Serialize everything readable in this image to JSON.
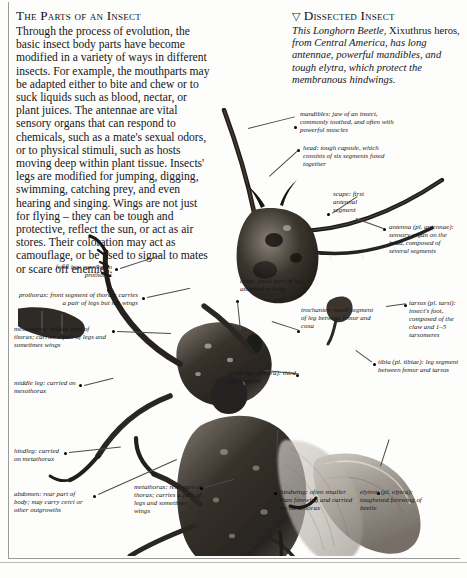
{
  "page": {
    "left_column": {
      "heading": "The Parts of an Insect",
      "body": "Through the process of evolution, the basic insect body parts have become modified in a variety of ways in different insects. For example, the mouthparts may be adapted either to bite and chew or to suck liquids such as blood, nectar, or plant juices. The antennae are vital sensory organs that can respond to chemicals, such as a mate's sexual odors, or to physical stimuli, such as hosts moving deep within plant tissue. Insects' legs are modified for jumping, digging, swimming, catching prey, and even hearing and singing. Wings are not just for flying – they can be tough and protective, reflect the sun, or act as air stores. Their coloration may act as camouflage, or be used to signal to mates or scare off enemies."
    },
    "right_column": {
      "marker": "▽",
      "heading": "Dissected Insect",
      "caption_part1": "This Longhorn Beetle",
      "caption_part2": ", Xixuthrus heros, ",
      "caption_part3": "from Central America, has long antennae, powerful mandibles, and tough elytra, which protect the membranous hindwings."
    },
    "figure": {
      "alt": "dissected longhorn beetle specimen photograph",
      "labels": [
        {
          "id": "mandibles",
          "text": "mandibles: jaw of an insect, commonly toothed, and often with powerful muscles"
        },
        {
          "id": "head",
          "text": "head: tough capsule, which consists of six segments fused together"
        },
        {
          "id": "scape",
          "text": "scape: first antennal segment"
        },
        {
          "id": "antenna",
          "text": "antenna (pl. antennae): sensory organ on the head, composed of several segments"
        },
        {
          "id": "front-leg",
          "text": "front leg: carried on prothorax"
        },
        {
          "id": "prothorax",
          "text": "prothorax: front segment of thorax; carries a pair of legs but not wings"
        },
        {
          "id": "mesothorax",
          "text": "mesothorax: middle part of thorax; carries a pair of legs and sometimes wings"
        },
        {
          "id": "middle-leg",
          "text": "middle leg: carried on mesothorax"
        },
        {
          "id": "hindleg",
          "text": "hindleg: carried on metathorax"
        },
        {
          "id": "abdomen",
          "text": "abdomen: rear part of body; may carry cerci or other outgrowths"
        },
        {
          "id": "coxa",
          "text": "coxa: basal part of leg, attached to body"
        },
        {
          "id": "trochanter",
          "text": "trochanter: small segment of leg between femur and coxa"
        },
        {
          "id": "femur",
          "text": "femur (pl. femora): third leg segment"
        },
        {
          "id": "tibia",
          "text": "tibia (pl. tibiae): leg segment between femur and tarsus"
        },
        {
          "id": "tarsus",
          "text": "tarsus (pl. tarsi): insect's foot, composed of the claw and 1–5 tarsomeres"
        },
        {
          "id": "metathorax",
          "text": "metathorax: rear part of thorax; carries a pair of legs and sometimes wings"
        },
        {
          "id": "hindwing",
          "text": "hindwing: often smaller than forewing and carried on metathorax"
        },
        {
          "id": "elytron",
          "text": "elytron (pl. elytra): toughened forewing of beetle"
        }
      ]
    },
    "colors": {
      "page_background": "#fdfdfb",
      "text": "#15151a",
      "rule": "#9a9a9a",
      "specimen_dark": "#2b2722",
      "specimen_mid": "#6d665e",
      "specimen_light": "#b8b2aa"
    }
  }
}
